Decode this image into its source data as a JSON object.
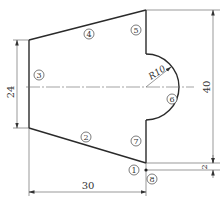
{
  "figure": {
    "type": "technical-drawing"
  },
  "dimensions": {
    "left_height": "24",
    "right_height": "40",
    "small_offset": "2",
    "bottom_width": "30",
    "arc_radius": "R10"
  },
  "labels": [
    {
      "id": "1",
      "text": "1"
    },
    {
      "id": "2",
      "text": "2"
    },
    {
      "id": "3",
      "text": "3"
    },
    {
      "id": "4",
      "text": "4"
    },
    {
      "id": "5",
      "text": "5"
    },
    {
      "id": "6",
      "text": "6"
    },
    {
      "id": "7",
      "text": "7"
    },
    {
      "id": "8",
      "text": "8"
    }
  ],
  "caption": ""
}
